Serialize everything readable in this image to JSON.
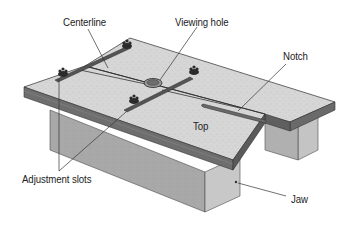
{
  "figure": {
    "type": "technical-illustration",
    "colors": {
      "top_surface": "#d4d4d4",
      "edge_dark": "#5a5a5a",
      "edge_mid": "#8a8a8a",
      "jaw_face": "#a9a9a9",
      "jaw_side": "#c6c6c6",
      "leader_line": "#333333",
      "hardware": "#2b2b2b"
    }
  },
  "labels": {
    "centerline": "Centerline",
    "viewing_hole": "Viewing hole",
    "notch": "Notch",
    "top": "Top",
    "adjustment_slots": "Adjustment slots",
    "jaw": "Jaw"
  }
}
